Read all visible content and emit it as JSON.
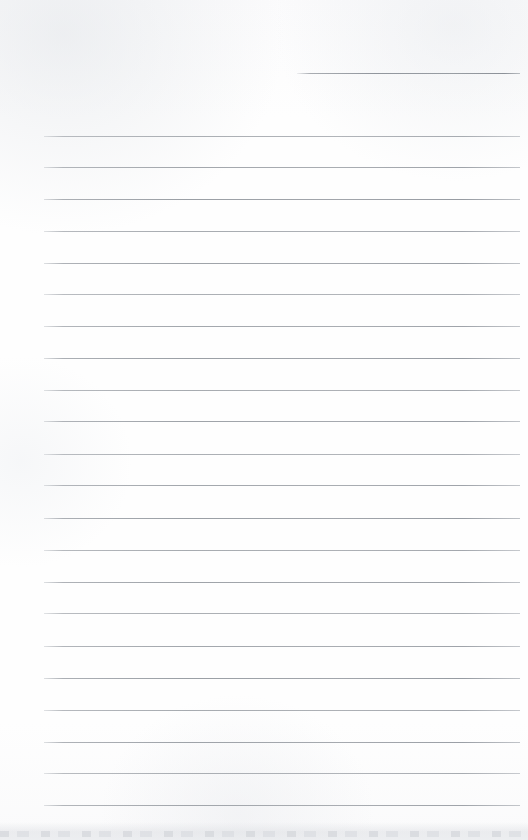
{
  "document": {
    "kind": "scanned-blank-lined-page",
    "page_width": 528,
    "page_height": 840,
    "background_color": "#fdfdfd",
    "rule_color": "#969ba1",
    "has_text": false,
    "text_content": ""
  },
  "layout": {
    "left_margin": 44,
    "right_margin": 520,
    "first_rule_y": 136,
    "last_rule_y": 805,
    "rule_spacing": 31.8,
    "rule_thickness": 1
  },
  "rules": {
    "header_rule": {
      "label": "header-rule",
      "x1": 297,
      "x2": 520,
      "y": 73
    },
    "body_rule_count": 22,
    "body_rules": [
      {
        "x1": 44,
        "x2": 520,
        "y": 136
      },
      {
        "x1": 44,
        "x2": 520,
        "y": 167
      },
      {
        "x1": 44,
        "x2": 520,
        "y": 199
      },
      {
        "x1": 44,
        "x2": 520,
        "y": 231
      },
      {
        "x1": 44,
        "x2": 520,
        "y": 263
      },
      {
        "x1": 44,
        "x2": 520,
        "y": 294
      },
      {
        "x1": 44,
        "x2": 520,
        "y": 326
      },
      {
        "x1": 44,
        "x2": 520,
        "y": 358
      },
      {
        "x1": 44,
        "x2": 520,
        "y": 390
      },
      {
        "x1": 44,
        "x2": 520,
        "y": 421
      },
      {
        "x1": 44,
        "x2": 520,
        "y": 454
      },
      {
        "x1": 44,
        "x2": 520,
        "y": 485
      },
      {
        "x1": 44,
        "x2": 520,
        "y": 518
      },
      {
        "x1": 44,
        "x2": 520,
        "y": 550
      },
      {
        "x1": 44,
        "x2": 520,
        "y": 582
      },
      {
        "x1": 44,
        "x2": 520,
        "y": 613
      },
      {
        "x1": 44,
        "x2": 520,
        "y": 646
      },
      {
        "x1": 44,
        "x2": 520,
        "y": 678
      },
      {
        "x1": 44,
        "x2": 520,
        "y": 710
      },
      {
        "x1": 44,
        "x2": 520,
        "y": 742
      },
      {
        "x1": 44,
        "x2": 520,
        "y": 773
      },
      {
        "x1": 44,
        "x2": 520,
        "y": 805
      }
    ]
  },
  "artifacts": {
    "bottom_edge_band": {
      "label": "scan-edge-shadow",
      "y_start": 822,
      "y_end": 840
    }
  }
}
